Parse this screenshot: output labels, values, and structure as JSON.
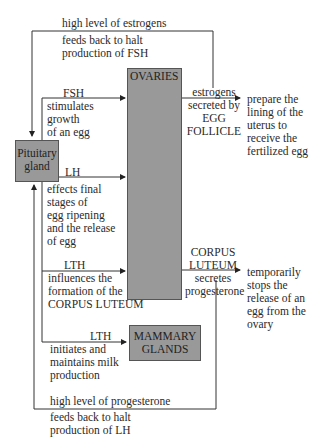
{
  "nodes": {
    "pituitary": "Pituitary gland",
    "pituitary_l1": "Pituitary",
    "pituitary_l2": "gland",
    "ovaries": "OVARIES",
    "mammary_l1": "MAMMARY",
    "mammary_l2": "GLANDS"
  },
  "labels": {
    "fb_estrogen": [
      "high level of estrogens",
      "feeds back to halt",
      "production of FSH"
    ],
    "fsh": [
      "FSH",
      "stimulates",
      "growth",
      "of an egg"
    ],
    "estrogens": [
      "estrogens",
      "secreted by",
      "EGG",
      "FOLLICLE"
    ],
    "uterus": [
      "prepare the",
      "lining of the",
      "uterus to",
      "receive the",
      "fertilized egg"
    ],
    "lh": [
      "LH",
      "effects final",
      "stages of",
      "egg ripening",
      "and the release",
      "of egg"
    ],
    "corpus": [
      "CORPUS",
      "LUTEUM",
      "secretes",
      "progesterone"
    ],
    "stops": [
      "temporarily",
      "stops the",
      "release of an",
      "egg from the",
      "ovary"
    ],
    "lth1": [
      "LTH",
      "influences the",
      "formation of the",
      "CORPUS LUTEUM"
    ],
    "lth2": [
      "LTH",
      "initiates and",
      "maintains milk",
      "production"
    ],
    "fb_prog": [
      "high level of progesterone",
      "feeds back to halt",
      "production of LH"
    ]
  }
}
